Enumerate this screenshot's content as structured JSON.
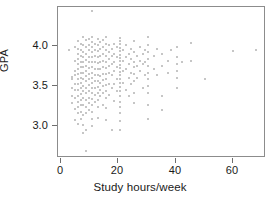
{
  "chart_data": {
    "type": "scatter",
    "title": "",
    "xlabel": "Study hours/week",
    "ylabel": "GPA",
    "xlim": [
      -2,
      71
    ],
    "ylim": [
      2.6,
      4.35
    ],
    "xticks": [
      0,
      20,
      40,
      60
    ],
    "xticklabels": [
      "0",
      "20",
      "40",
      "60"
    ],
    "yticks": [
      3.0,
      3.5,
      4.0
    ],
    "yticklabels": [
      "3.0",
      "3.5",
      "4.0"
    ],
    "grid": false,
    "legend": null,
    "marker": {
      "shape": "circle",
      "color": "#b3b3b3",
      "size_px": 2
    },
    "frame_color": "#8c8c8c",
    "background": "#ffffff",
    "n_points": 198,
    "points": [
      [
        2,
        3.85
      ],
      [
        3,
        3.53
      ],
      [
        3,
        3.5
      ],
      [
        3,
        3.4
      ],
      [
        3,
        3.3
      ],
      [
        3,
        3.22
      ],
      [
        4,
        3.88
      ],
      [
        4,
        3.72
      ],
      [
        4,
        3.6
      ],
      [
        4,
        3.55
      ],
      [
        4,
        3.45
      ],
      [
        4,
        3.38
      ],
      [
        4,
        3.28
      ],
      [
        4,
        3.15
      ],
      [
        4,
        3.02
      ],
      [
        5,
        3.95
      ],
      [
        5,
        3.86
      ],
      [
        5,
        3.8
      ],
      [
        5,
        3.74
      ],
      [
        5,
        3.68
      ],
      [
        5,
        3.62
      ],
      [
        5,
        3.56
      ],
      [
        5,
        3.5
      ],
      [
        5,
        3.44
      ],
      [
        5,
        3.38
      ],
      [
        5,
        3.3
      ],
      [
        5,
        3.24
      ],
      [
        5,
        3.18
      ],
      [
        5,
        3.1
      ],
      [
        5,
        2.98
      ],
      [
        6,
        3.92
      ],
      [
        6,
        3.84
      ],
      [
        6,
        3.78
      ],
      [
        6,
        3.7
      ],
      [
        6,
        3.64
      ],
      [
        6,
        3.58
      ],
      [
        6,
        3.52
      ],
      [
        6,
        3.46
      ],
      [
        6,
        3.4
      ],
      [
        6,
        3.33
      ],
      [
        6,
        3.26
      ],
      [
        6,
        3.2
      ],
      [
        6,
        3.12
      ],
      [
        6,
        3.04
      ],
      [
        7,
        4.0
      ],
      [
        7,
        3.9
      ],
      [
        7,
        3.82
      ],
      [
        7,
        3.76
      ],
      [
        7,
        3.7
      ],
      [
        7,
        3.64
      ],
      [
        7,
        3.58
      ],
      [
        7,
        3.5
      ],
      [
        7,
        3.42
      ],
      [
        7,
        3.36
      ],
      [
        7,
        3.28
      ],
      [
        7,
        3.2
      ],
      [
        7,
        3.08
      ],
      [
        7,
        2.96
      ],
      [
        7,
        2.87
      ],
      [
        8,
        3.96
      ],
      [
        8,
        3.88
      ],
      [
        8,
        3.8
      ],
      [
        8,
        3.73
      ],
      [
        8,
        3.66
      ],
      [
        8,
        3.6
      ],
      [
        8,
        3.54
      ],
      [
        8,
        3.48
      ],
      [
        8,
        3.4
      ],
      [
        8,
        3.34
      ],
      [
        8,
        3.26
      ],
      [
        8,
        3.18
      ],
      [
        8,
        3.1
      ],
      [
        8,
        2.9
      ],
      [
        8,
        2.66
      ],
      [
        9,
        3.98
      ],
      [
        9,
        3.9
      ],
      [
        9,
        3.84
      ],
      [
        9,
        3.76
      ],
      [
        9,
        3.7
      ],
      [
        9,
        3.63
      ],
      [
        9,
        3.56
      ],
      [
        9,
        3.5
      ],
      [
        9,
        3.43
      ],
      [
        9,
        3.36
      ],
      [
        9,
        3.28
      ],
      [
        9,
        3.22
      ],
      [
        9,
        3.14
      ],
      [
        10,
        4.3
      ],
      [
        10,
        4.0
      ],
      [
        10,
        3.94
      ],
      [
        10,
        3.88
      ],
      [
        10,
        3.82
      ],
      [
        10,
        3.76
      ],
      [
        10,
        3.7
      ],
      [
        10,
        3.64
      ],
      [
        10,
        3.58
      ],
      [
        10,
        3.52
      ],
      [
        10,
        3.46
      ],
      [
        10,
        3.4
      ],
      [
        10,
        3.34
      ],
      [
        10,
        3.27
      ],
      [
        10,
        3.2
      ],
      [
        10,
        3.12
      ],
      [
        10,
        3.04
      ],
      [
        10,
        2.95
      ],
      [
        11,
        3.92
      ],
      [
        11,
        3.84
      ],
      [
        11,
        3.77
      ],
      [
        11,
        3.7
      ],
      [
        11,
        3.62
      ],
      [
        11,
        3.55
      ],
      [
        11,
        3.48
      ],
      [
        11,
        3.4
      ],
      [
        11,
        3.32
      ],
      [
        11,
        3.24
      ],
      [
        12,
        3.98
      ],
      [
        12,
        3.9
      ],
      [
        12,
        3.83
      ],
      [
        12,
        3.76
      ],
      [
        12,
        3.69
      ],
      [
        12,
        3.62
      ],
      [
        12,
        3.55
      ],
      [
        12,
        3.48
      ],
      [
        12,
        3.41
      ],
      [
        12,
        3.34
      ],
      [
        12,
        3.26
      ],
      [
        12,
        3.18
      ],
      [
        12,
        3.05
      ],
      [
        13,
        3.94
      ],
      [
        13,
        3.86
      ],
      [
        13,
        3.78
      ],
      [
        13,
        3.7
      ],
      [
        13,
        3.62
      ],
      [
        13,
        3.54
      ],
      [
        13,
        3.46
      ],
      [
        13,
        3.38
      ],
      [
        13,
        3.3
      ],
      [
        14,
        3.96
      ],
      [
        14,
        3.88
      ],
      [
        14,
        3.8
      ],
      [
        14,
        3.72
      ],
      [
        14,
        3.64
      ],
      [
        14,
        3.56
      ],
      [
        14,
        3.49
      ],
      [
        14,
        3.42
      ],
      [
        14,
        3.34
      ],
      [
        14,
        3.2
      ],
      [
        15,
        4.0
      ],
      [
        15,
        3.92
      ],
      [
        15,
        3.85
      ],
      [
        15,
        3.78
      ],
      [
        15,
        3.7
      ],
      [
        15,
        3.63
      ],
      [
        15,
        3.56
      ],
      [
        15,
        3.5
      ],
      [
        15,
        3.43
      ],
      [
        15,
        3.36
      ],
      [
        15,
        3.28
      ],
      [
        15,
        3.16
      ],
      [
        15,
        3.02
      ],
      [
        16,
        3.9
      ],
      [
        16,
        3.82
      ],
      [
        16,
        3.74
      ],
      [
        16,
        3.66
      ],
      [
        16,
        3.58
      ],
      [
        16,
        3.45
      ],
      [
        16,
        3.32
      ],
      [
        17,
        3.86
      ],
      [
        17,
        3.78
      ],
      [
        17,
        3.68
      ],
      [
        17,
        3.55
      ],
      [
        17,
        3.4
      ],
      [
        17,
        2.9
      ],
      [
        18,
        3.92
      ],
      [
        18,
        3.8
      ],
      [
        18,
        3.7
      ],
      [
        18,
        3.6
      ],
      [
        18,
        3.44
      ],
      [
        18,
        3.25
      ],
      [
        19,
        3.88
      ],
      [
        19,
        3.76
      ],
      [
        19,
        3.64
      ],
      [
        19,
        3.5
      ],
      [
        19,
        3.36
      ],
      [
        20,
        3.99
      ],
      [
        20,
        3.95
      ],
      [
        20,
        3.91
      ],
      [
        20,
        3.87
      ],
      [
        20,
        3.83
      ],
      [
        20,
        3.79
      ],
      [
        20,
        3.75
      ],
      [
        20,
        3.71
      ],
      [
        20,
        3.67
      ],
      [
        20,
        3.63
      ],
      [
        20,
        3.59
      ],
      [
        20,
        3.55
      ],
      [
        20,
        3.51
      ],
      [
        20,
        3.46
      ],
      [
        20,
        3.41
      ],
      [
        20,
        3.36
      ],
      [
        20,
        3.3
      ],
      [
        20,
        3.24
      ],
      [
        20,
        3.18
      ],
      [
        20,
        3.1
      ],
      [
        20,
        3.01
      ],
      [
        20,
        2.91
      ],
      [
        21,
        3.84
      ],
      [
        21,
        3.72
      ],
      [
        21,
        3.6
      ],
      [
        21,
        3.46
      ],
      [
        22,
        3.9
      ],
      [
        22,
        3.76
      ],
      [
        22,
        3.62
      ],
      [
        22,
        3.38
      ],
      [
        23,
        3.8
      ],
      [
        23,
        3.68
      ],
      [
        23,
        3.52
      ],
      [
        23,
        3.3
      ],
      [
        24,
        3.86
      ],
      [
        24,
        3.74
      ],
      [
        24,
        3.58
      ],
      [
        24,
        3.44
      ],
      [
        25,
        3.95
      ],
      [
        25,
        3.82
      ],
      [
        25,
        3.7
      ],
      [
        25,
        3.64
      ],
      [
        25,
        3.56
      ],
      [
        25,
        3.48
      ],
      [
        25,
        3.34
      ],
      [
        25,
        3.22
      ],
      [
        26,
        3.78
      ],
      [
        26,
        3.66
      ],
      [
        26,
        3.52
      ],
      [
        27,
        3.88
      ],
      [
        27,
        3.72
      ],
      [
        27,
        3.6
      ],
      [
        28,
        3.8
      ],
      [
        28,
        3.68
      ],
      [
        28,
        3.4
      ],
      [
        29,
        3.84
      ],
      [
        29,
        3.7
      ],
      [
        29,
        3.55
      ],
      [
        30,
        4.0
      ],
      [
        30,
        3.9
      ],
      [
        30,
        3.82
      ],
      [
        30,
        3.74
      ],
      [
        30,
        3.66
      ],
      [
        30,
        3.58
      ],
      [
        30,
        3.5
      ],
      [
        30,
        3.42
      ],
      [
        30,
        3.34
      ],
      [
        30,
        3.2
      ],
      [
        30,
        3.03
      ],
      [
        32,
        3.78
      ],
      [
        32,
        3.62
      ],
      [
        33,
        3.86
      ],
      [
        33,
        3.55
      ],
      [
        35,
        3.8
      ],
      [
        35,
        3.66
      ],
      [
        35,
        3.3
      ],
      [
        35,
        3.14
      ],
      [
        37,
        3.72
      ],
      [
        37,
        3.58
      ],
      [
        38,
        3.84
      ],
      [
        40,
        3.88
      ],
      [
        40,
        3.76
      ],
      [
        40,
        3.68
      ],
      [
        40,
        3.6
      ],
      [
        40,
        3.52
      ],
      [
        40,
        3.4
      ],
      [
        42,
        3.7
      ],
      [
        45,
        3.93
      ],
      [
        45,
        3.72
      ],
      [
        50,
        3.5
      ],
      [
        60,
        3.83
      ],
      [
        68,
        3.85
      ]
    ]
  }
}
